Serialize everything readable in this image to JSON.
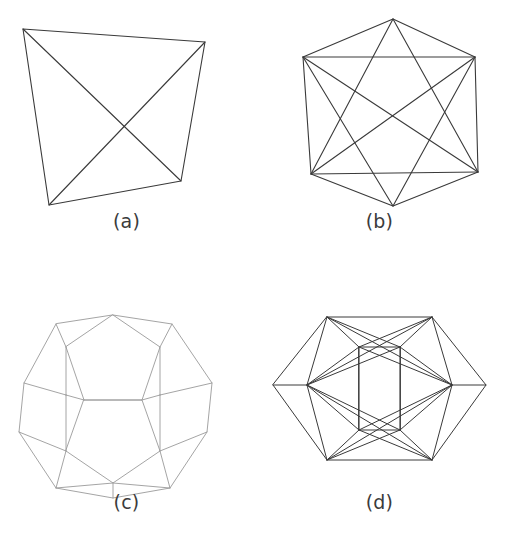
{
  "figure": {
    "background_color": "#ffffff",
    "width": 506,
    "height": 549,
    "layout": "2x2 grid of line-drawing panels, each with a lettered caption below"
  },
  "style": {
    "dark_stroke_color": "#3a3a3a",
    "light_stroke_color": "#9a9a9a",
    "caption_color": "#3b3b3b",
    "stroke_width_dark": 1.1,
    "stroke_width_light": 0.9
  },
  "panels": [
    {
      "id": "a",
      "caption": "(a)",
      "solid_name": "tetrahedron",
      "faces": 4,
      "vertices": 4,
      "edges": 6,
      "stroke_color": "#3a3a3a",
      "outline": "quadrilateral",
      "points": {
        "top_left": [
          23,
          29
        ],
        "top_right": [
          205,
          42
        ],
        "bottom_right": [
          181,
          181
        ],
        "bottom_left": [
          49,
          205
        ]
      }
    },
    {
      "id": "b",
      "caption": "(b)",
      "solid_name": "octahedron",
      "faces": 8,
      "vertices": 6,
      "edges": 12,
      "stroke_color": "#3a3a3a",
      "outline": "hexagon with inscribed star of two triangles",
      "points": {
        "top": [
          140,
          19
        ],
        "upper_left": [
          50,
          57
        ],
        "upper_right": [
          222,
          57
        ],
        "lower_right": [
          225,
          172
        ],
        "lower_left": [
          58,
          174
        ],
        "bottom": [
          140,
          206
        ]
      }
    },
    {
      "id": "c",
      "caption": "(c)",
      "solid_name": "dodecahedron",
      "faces": 12,
      "vertices": 20,
      "edges": 30,
      "stroke_color": "#9a9a9a",
      "outline": "decagon with inner pentagon ring",
      "points": {
        "outer_top": [
          113,
          40
        ],
        "outer_top_right": [
          172,
          49
        ],
        "outer_right_upper": [
          212,
          108
        ],
        "outer_right_lower": [
          207,
          157
        ],
        "outer_bottom_right": [
          170,
          213
        ],
        "outer_bottom": [
          113,
          223
        ],
        "outer_bottom_left": [
          56,
          213
        ],
        "outer_left_lower": [
          19,
          157
        ],
        "outer_left_upper": [
          24,
          108
        ],
        "outer_top_left": [
          56,
          49
        ]
      }
    },
    {
      "id": "d",
      "caption": "(d)",
      "solid_name": "icosahedron",
      "faces": 20,
      "vertices": 12,
      "edges": 30,
      "stroke_color": "#3a3a3a",
      "outline": "hexagon with full internal triangulation",
      "points": {
        "top_left": [
          37,
          37
        ],
        "top_right": [
          142,
          37
        ],
        "right": [
          200,
          108
        ],
        "bottom_right": [
          142,
          180
        ],
        "bottom_left": [
          37,
          180
        ],
        "left": [
          -20,
          108
        ]
      }
    }
  ]
}
